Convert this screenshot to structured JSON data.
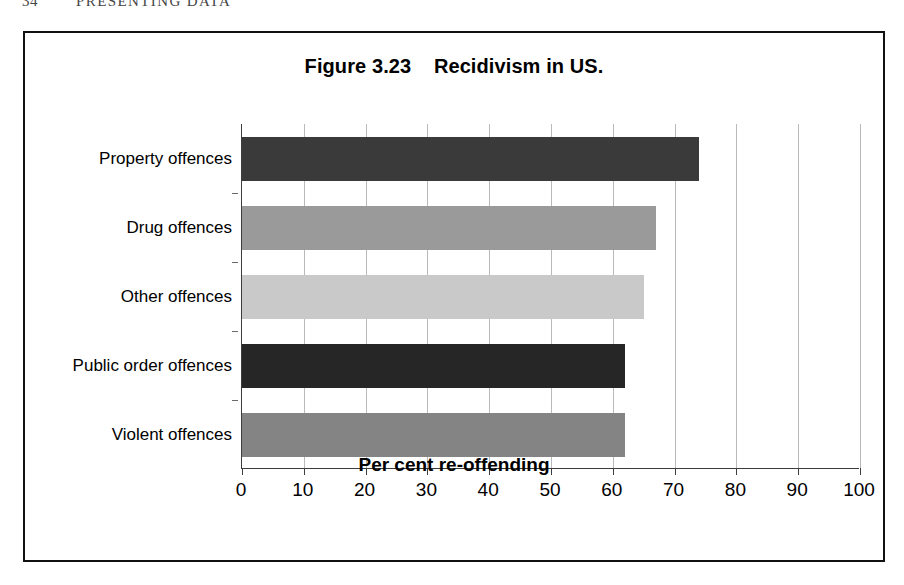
{
  "page": {
    "folio": "34",
    "running_head": "PRESENTING DATA"
  },
  "figure": {
    "title": "Figure 3.23    Recidivism in US."
  },
  "chart_data": {
    "type": "bar",
    "orientation": "horizontal",
    "title": "Figure 3.23    Recidivism in US.",
    "xlabel": "Per cent re-offending",
    "ylabel": "",
    "categories": [
      "Property offences",
      "Drug offences",
      "Other offences",
      "Public order offences",
      "Violent offences"
    ],
    "values": [
      74,
      67,
      65,
      62,
      62
    ],
    "bar_colors": [
      "#3a3a3a",
      "#9a9a9a",
      "#c9c9c9",
      "#262626",
      "#848484"
    ],
    "xlim": [
      0,
      100
    ],
    "xticks": [
      0,
      10,
      20,
      30,
      40,
      50,
      60,
      70,
      80,
      90,
      100
    ],
    "xtick_labels": [
      "0",
      "10",
      "20",
      "30",
      "40",
      "50",
      "60",
      "70",
      "80",
      "90",
      "100"
    ],
    "grid": "vertical",
    "gridline_color": "#b9b9b9",
    "legend": "none",
    "frame": "figure box border"
  }
}
